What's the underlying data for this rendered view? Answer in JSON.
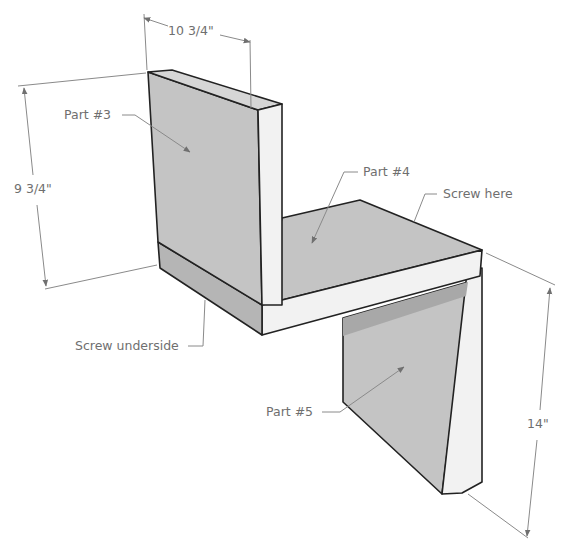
{
  "diagram": {
    "type": "isometric-assembly-drawing",
    "colors": {
      "panel_face": "#c4c4c4",
      "panel_edge": "#f2f2f2",
      "outline": "#222222",
      "annotation": "#6f6f6f"
    },
    "dimensions": {
      "width_top": "10 3/4\"",
      "height_back": "9 3/4\"",
      "height_leg": "14\""
    },
    "labels": {
      "part3": "Part #3",
      "part4": "Part #4",
      "part5": "Part #5",
      "screw_here": "Screw here",
      "screw_underside": "Screw underside"
    },
    "parts": [
      {
        "id": "part3",
        "name": "Part #3",
        "role": "back vertical panel"
      },
      {
        "id": "part4",
        "name": "Part #4",
        "role": "horizontal seat panel"
      },
      {
        "id": "part5",
        "name": "Part #5",
        "role": "front vertical leg panel"
      }
    ]
  }
}
